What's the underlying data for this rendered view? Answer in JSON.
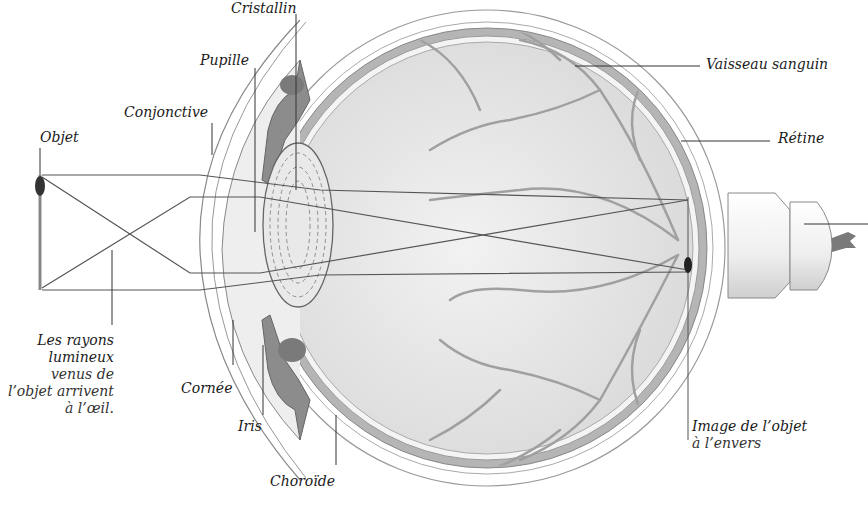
{
  "diagram": {
    "type": "anatomical-cross-section",
    "colors": {
      "background": "#ffffff",
      "line": "#555555",
      "sclera_band": "#a8a8a8",
      "vitreous_fill": "#e6e6e6",
      "vessel": "#9a9a9a",
      "iris_fill": "#8c8c8c",
      "object": "#333333"
    }
  },
  "labels": {
    "cristallin": "Cristallin",
    "pupille": "Pupille",
    "conjonctive": "Conjonctive",
    "objet": "Objet",
    "vaisseau": "Vaisseau sanguin",
    "retine": "Rétine",
    "rays_line1": "Les rayons",
    "rays_line2": "lumineux",
    "rays_line3": "venus de",
    "rays_line4": "l’objet arrivent",
    "rays_line5": "à l’œil.",
    "cornee": "Cornée",
    "iris": "Iris",
    "choroide": "Choroïde",
    "image_line1": "Image de l’objet",
    "image_line2": "à l’envers"
  }
}
